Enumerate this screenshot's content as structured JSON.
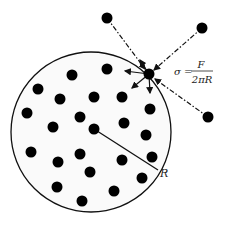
{
  "diagram": {
    "circle": {
      "cx": 91,
      "cy": 132,
      "r": 80,
      "fill": "#fafafa",
      "stroke": "#111111"
    },
    "radius_label": "R",
    "formula": {
      "lhs": "σ =",
      "numerator": "F",
      "denominator": "2πR"
    },
    "surface_particle": {
      "x": 149,
      "y": 74
    },
    "external_particles": [
      {
        "x": 107,
        "y": 18
      },
      {
        "x": 202,
        "y": 28
      },
      {
        "x": 208,
        "y": 117
      }
    ],
    "internal_particles": [
      {
        "x": 107,
        "y": 69
      },
      {
        "x": 72,
        "y": 75
      },
      {
        "x": 38,
        "y": 89
      },
      {
        "x": 60,
        "y": 99
      },
      {
        "x": 94,
        "y": 97
      },
      {
        "x": 122,
        "y": 97
      },
      {
        "x": 150,
        "y": 109
      },
      {
        "x": 27,
        "y": 113
      },
      {
        "x": 80,
        "y": 117
      },
      {
        "x": 53,
        "y": 127
      },
      {
        "x": 94,
        "y": 129
      },
      {
        "x": 124,
        "y": 123
      },
      {
        "x": 146,
        "y": 135
      },
      {
        "x": 31,
        "y": 152
      },
      {
        "x": 80,
        "y": 154
      },
      {
        "x": 58,
        "y": 162
      },
      {
        "x": 122,
        "y": 160
      },
      {
        "x": 152,
        "y": 157
      },
      {
        "x": 90,
        "y": 172
      },
      {
        "x": 142,
        "y": 178
      },
      {
        "x": 57,
        "y": 187
      },
      {
        "x": 114,
        "y": 191
      },
      {
        "x": 82,
        "y": 201
      }
    ],
    "colors": {
      "particle": "#000000",
      "line": "#111111"
    }
  }
}
